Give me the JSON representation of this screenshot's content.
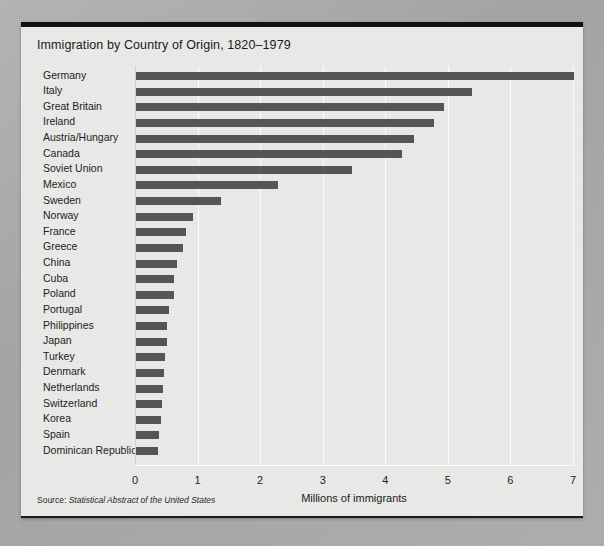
{
  "figure": {
    "title": "Immigration by Country of Origin, 1820–1979",
    "source_prefix": "Source: ",
    "source_italic": "Statistical Abstract of the United States",
    "accent_rule_color": "#111111",
    "bar_color": "#555553",
    "panel_color": "#e9e9e7",
    "gridline_color": "#fbfbfb"
  },
  "chart_data": {
    "type": "bar",
    "orientation": "horizontal",
    "title": "Immigration by Country of Origin, 1820–1979",
    "xlabel": "Millions of immigrants",
    "ylabel": "",
    "xlim": [
      0,
      7
    ],
    "xticks": [
      "0",
      "1",
      "2",
      "3",
      "4",
      "5",
      "6",
      "7"
    ],
    "xtick_values": [
      0,
      1,
      2,
      3,
      4,
      5,
      6,
      7
    ],
    "grid": true,
    "grid_axis": "x",
    "legend": false,
    "units": "millions",
    "categories": [
      "Germany",
      "Italy",
      "Great Britain",
      "Ireland",
      "Austria/Hungary",
      "Canada",
      "Soviet Union",
      "Mexico",
      "Sweden",
      "Norway",
      "France",
      "Greece",
      "China",
      "Cuba",
      "Poland",
      "Portugal",
      "Philippines",
      "Japan",
      "Turkey",
      "Denmark",
      "Netherlands",
      "Switzerland",
      "Korea",
      "Spain",
      "Dominican Republic"
    ],
    "values": [
      7.0,
      5.37,
      4.93,
      4.76,
      4.44,
      4.25,
      3.45,
      2.27,
      1.36,
      0.91,
      0.8,
      0.75,
      0.66,
      0.61,
      0.6,
      0.52,
      0.5,
      0.49,
      0.46,
      0.45,
      0.43,
      0.42,
      0.4,
      0.37,
      0.35
    ]
  }
}
